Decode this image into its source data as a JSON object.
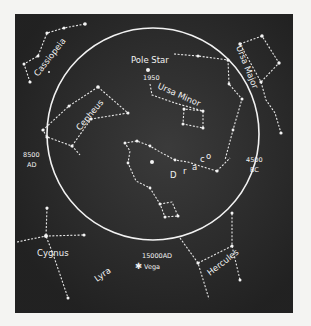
{
  "constellations": [
    {
      "id": "cassiopeia",
      "name": "Cassiopeia"
    },
    {
      "id": "ursa-major",
      "name": "Ursa Major"
    },
    {
      "id": "ursa-minor",
      "name": "Ursa Minor"
    },
    {
      "id": "cepheus",
      "name": "Cepheus"
    },
    {
      "id": "draco",
      "name": "Draco",
      "letters": [
        "D",
        "r",
        "a",
        "c",
        "o"
      ]
    },
    {
      "id": "cygnus",
      "name": "Cygnus"
    },
    {
      "id": "lyra",
      "name": "Lyra"
    },
    {
      "id": "hercules",
      "name": "Hercules"
    }
  ],
  "markers": {
    "pole_star": "Pole Star",
    "year_1950": "1950",
    "ad_8500": {
      "year": "8500",
      "era": "AD"
    },
    "bc_4500": {
      "year": "4500",
      "era": "BC"
    },
    "ad_15000": "15000AD",
    "vega": "Vega",
    "vega_symbol": "✱"
  },
  "colors": {
    "background": "#2f2f2f",
    "foreground": "#f2f2f2",
    "page": "#f4f4f2"
  }
}
